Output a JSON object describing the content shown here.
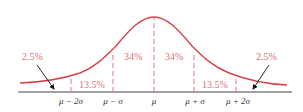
{
  "diagram": {
    "colors": {
      "curve": "#d9404a",
      "dashes": "#e07c84",
      "labels": "#d9737a",
      "axis": "#444444",
      "arrows": "#111111"
    },
    "axis_labels": [
      "μ − 2σ",
      "μ − σ",
      "μ",
      "μ + σ",
      "μ + 2σ"
    ],
    "region_labels": {
      "left_tail": "2.5%",
      "left_outer": "13.5%",
      "left_inner": "34%",
      "right_inner": "34%",
      "right_outer": "13.5%",
      "right_tail": "2.5%"
    }
  }
}
